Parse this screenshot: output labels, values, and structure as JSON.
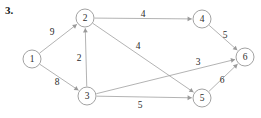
{
  "figure": {
    "problem_number": "3.",
    "type": "directed-weighted-graph",
    "width": 261,
    "height": 118,
    "background_color": "#ffffff",
    "node_stroke_color": "#8a8a8a",
    "edge_stroke_color": "#9a9a9a",
    "text_color": "#2b2b2b"
  },
  "chart_data": {
    "type": "diagram",
    "title": "3.",
    "nodes": [
      {
        "id": "1",
        "label": "1",
        "x": 32,
        "y": 59,
        "r": 9
      },
      {
        "id": "2",
        "label": "2",
        "x": 85,
        "y": 18,
        "r": 9
      },
      {
        "id": "3",
        "label": "3",
        "x": 87,
        "y": 96,
        "r": 9
      },
      {
        "id": "4",
        "label": "4",
        "x": 202,
        "y": 19,
        "r": 9
      },
      {
        "id": "5",
        "label": "5",
        "x": 202,
        "y": 98,
        "r": 9
      },
      {
        "id": "6",
        "label": "6",
        "x": 245,
        "y": 57,
        "r": 9
      }
    ],
    "edges": [
      {
        "from": "1",
        "to": "2",
        "weight": "9",
        "label_x": 52,
        "label_y": 32
      },
      {
        "from": "1",
        "to": "3",
        "weight": "8",
        "label_x": 57,
        "label_y": 82
      },
      {
        "from": "3",
        "to": "2",
        "weight": "2",
        "label_x": 79,
        "label_y": 58
      },
      {
        "from": "2",
        "to": "4",
        "weight": "4",
        "label_x": 143,
        "label_y": 14
      },
      {
        "from": "2",
        "to": "5",
        "weight": "4",
        "label_x": 138,
        "label_y": 46
      },
      {
        "from": "3",
        "to": "6",
        "weight": "3",
        "label_x": 198,
        "label_y": 62
      },
      {
        "from": "3",
        "to": "5",
        "weight": "5",
        "label_x": 140,
        "label_y": 105
      },
      {
        "from": "4",
        "to": "6",
        "weight": "5",
        "label_x": 225,
        "label_y": 35
      },
      {
        "from": "5",
        "to": "6",
        "weight": "6",
        "label_x": 222,
        "label_y": 80
      }
    ]
  }
}
